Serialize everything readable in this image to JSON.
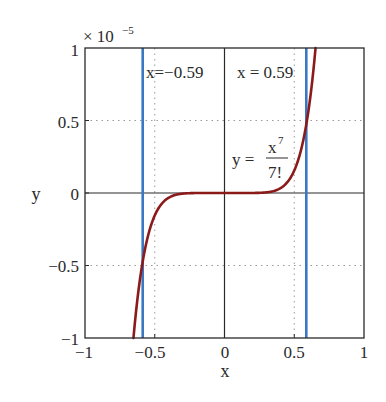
{
  "chart_data": {
    "type": "line",
    "title": "",
    "xlabel": "x",
    "ylabel": "y",
    "xlim": [
      -1,
      1
    ],
    "ylim": [
      -1,
      1
    ],
    "y_multiplier": "× 10",
    "y_multiplier_exponent": "−5",
    "y_scale": 1e-05,
    "grid": "dotted",
    "xticks": [
      -1,
      -0.5,
      0,
      0.5,
      1
    ],
    "xtick_labels": [
      "−1",
      "−0.5",
      "0",
      "0.5",
      "1"
    ],
    "yticks": [
      -1,
      -0.5,
      0,
      0.5,
      1
    ],
    "ytick_labels": [
      "−1",
      "−0.5",
      "0",
      "0.5",
      "1"
    ],
    "series": [
      {
        "name": "y = x^7/7!",
        "color": "#8b1a1a",
        "function": "x^7/5040",
        "x": [
          -0.653,
          -0.6,
          -0.55,
          -0.5,
          -0.4,
          -0.3,
          -0.2,
          -0.1,
          0,
          0.1,
          0.2,
          0.3,
          0.4,
          0.5,
          0.55,
          0.6,
          0.653
        ],
        "y_scaled_1e-5": [
          -1.0,
          -0.555,
          -0.303,
          -0.155,
          -0.033,
          -0.004,
          -0.0003,
          0,
          0,
          0,
          0.0003,
          0.004,
          0.033,
          0.155,
          0.303,
          0.555,
          1.0
        ]
      },
      {
        "name": "x = -0.59",
        "color": "#3a78c4",
        "type": "vline",
        "x": -0.59
      },
      {
        "name": "x = 0.59",
        "color": "#3a78c4",
        "type": "vline",
        "x": 0.59
      }
    ],
    "annotations": [
      {
        "text": "x=−0.59",
        "x": -0.55,
        "y": 0.9
      },
      {
        "text": "x = 0.59",
        "x": 0.1,
        "y": 0.9
      },
      {
        "text_prefix": "y =",
        "numerator": "x",
        "numerator_exponent": "7",
        "denominator": "7!",
        "x": 0.2,
        "y": 0.3
      }
    ]
  },
  "labels": {
    "xlabel": "x",
    "ylabel": "y",
    "multiplier": "× 10",
    "multiplier_exp": "−5",
    "vline_left": "x=−0.59",
    "vline_right": "x = 0.59",
    "eq_prefix": "y =",
    "eq_num": "x",
    "eq_num_exp": "7",
    "eq_den": "7!",
    "xt0": "−1",
    "xt1": "−0.5",
    "xt2": "0",
    "xt3": "0.5",
    "xt4": "1",
    "yt0": "−1",
    "yt1": "−0.5",
    "yt2": "0",
    "yt3": "0.5",
    "yt4": "1"
  },
  "colors": {
    "curve": "#8b1a1a",
    "vline": "#3a78c4",
    "axis": "#2a2a2a",
    "grid": "#9a9a9a"
  }
}
